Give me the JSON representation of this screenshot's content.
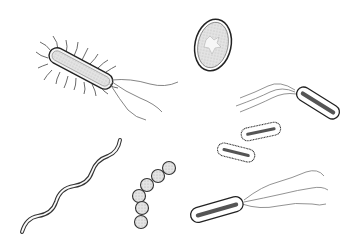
{
  "image": {
    "description": "Hand-drawn ink illustration of various bacteria shapes on white background",
    "width": 356,
    "height": 247,
    "background": "#ffffff",
    "stroke_color": "#2a2a2a",
    "fill_color": "#e8e8e8",
    "organisms": [
      {
        "type": "bacillus-peritrichous",
        "label": "rod with pili and flagella",
        "position": "top-left"
      },
      {
        "type": "spore-oval",
        "label": "oval spore/cell",
        "position": "top-center"
      },
      {
        "type": "bacillus-polar-flagella",
        "label": "rod with lophotrichous flagella",
        "position": "top-right"
      },
      {
        "type": "small-bacilli-pair",
        "label": "two small hairy rods",
        "position": "middle-right"
      },
      {
        "type": "spirillum",
        "label": "spiral bacterium",
        "position": "bottom-left"
      },
      {
        "type": "streptococcus",
        "label": "chain of cocci",
        "position": "bottom-center"
      },
      {
        "type": "bacillus-flagellated",
        "label": "rod with trailing flagella",
        "position": "bottom-right"
      }
    ]
  }
}
